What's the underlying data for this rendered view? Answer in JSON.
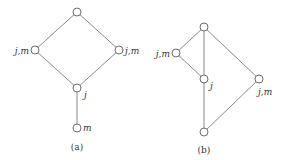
{
  "diagrams": {
    "a": {
      "caption": "(a)",
      "nodes": [
        {
          "id": "top",
          "x": 77,
          "y": 12,
          "label": ""
        },
        {
          "id": "left",
          "x": 35,
          "y": 50,
          "label": "j,m"
        },
        {
          "id": "right",
          "x": 119,
          "y": 50,
          "label": "j,m"
        },
        {
          "id": "mid",
          "x": 77,
          "y": 88,
          "label": "j"
        },
        {
          "id": "bottom",
          "x": 77,
          "y": 128,
          "label": "m"
        }
      ],
      "edges": [
        [
          "top",
          "left"
        ],
        [
          "top",
          "right"
        ],
        [
          "left",
          "mid"
        ],
        [
          "right",
          "mid"
        ],
        [
          "mid",
          "bottom"
        ]
      ]
    },
    "b": {
      "caption": "(b)",
      "nodes": [
        {
          "id": "top",
          "x": 204,
          "y": 27,
          "label": ""
        },
        {
          "id": "left",
          "x": 176,
          "y": 53,
          "label": "j,m"
        },
        {
          "id": "mid",
          "x": 204,
          "y": 79,
          "label": "j"
        },
        {
          "id": "right",
          "x": 259,
          "y": 79,
          "label": "j,m"
        },
        {
          "id": "bottom",
          "x": 204,
          "y": 132,
          "label": ""
        }
      ],
      "edges": [
        [
          "top",
          "left"
        ],
        [
          "top",
          "mid"
        ],
        [
          "top",
          "right"
        ],
        [
          "left",
          "mid"
        ],
        [
          "mid",
          "bottom"
        ],
        [
          "right",
          "bottom"
        ]
      ]
    }
  }
}
